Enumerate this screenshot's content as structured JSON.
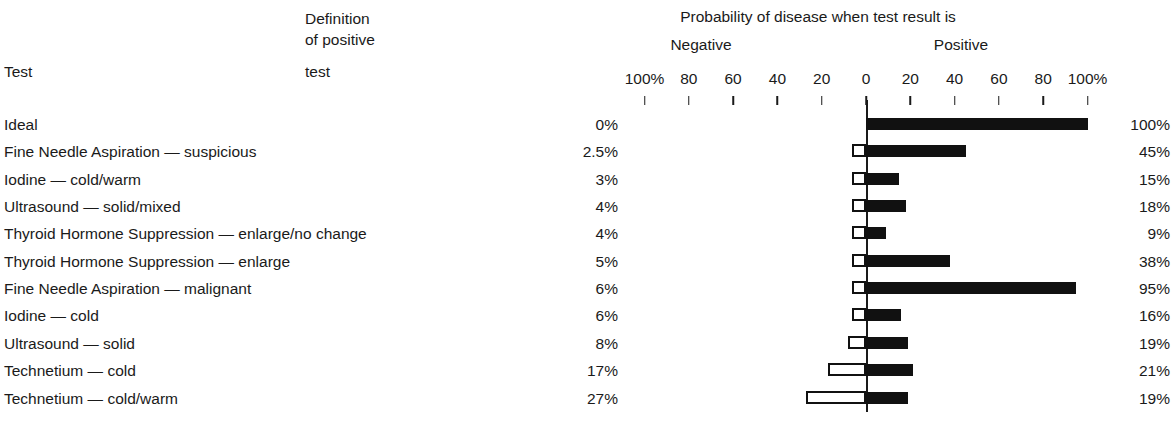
{
  "header": {
    "main_title": "Probability of disease when test result is",
    "negative_label": "Negative",
    "positive_label": "Positive",
    "test_column_label": "Test",
    "definition_column_lines": [
      "Definition",
      "of positive",
      "test"
    ],
    "definition_column_label": "test"
  },
  "axis": {
    "tick_labels": [
      "100%",
      "80",
      "60",
      "40",
      "20",
      "0",
      "20",
      "40",
      "60",
      "80",
      "100%"
    ],
    "tick_values": [
      -100,
      -80,
      -60,
      -40,
      -20,
      0,
      20,
      40,
      60,
      80,
      100
    ],
    "zero_label": "0"
  },
  "colors": {
    "ink": "#1a1a1a",
    "bar_positive": "#111111",
    "bar_negative_fill": "#ffffff",
    "bar_negative_stroke": "#111111",
    "background": "#ffffff"
  },
  "chart_data": {
    "type": "bar",
    "title": "Probability of disease when test result is",
    "subtitle": "",
    "xlabel": "",
    "ylabel": "",
    "orientation": "horizontal-diverging",
    "xlim": [
      -100,
      100
    ],
    "grid": false,
    "legend_position": "none",
    "axis_tick_labels": [
      "100%",
      "80",
      "60",
      "40",
      "20",
      "0",
      "20",
      "40",
      "60",
      "80",
      "100%"
    ],
    "categories": [
      "Ideal",
      "Fine Needle Aspiration — suspicious",
      "Iodine — cold/warm",
      "Ultrasound — solid/mixed",
      "Thyroid Hormone Suppression — enlarge/no change",
      "Thyroid Hormone Suppression — enlarge",
      "Fine Needle Aspiration — malignant",
      "Iodine — cold",
      "Ultrasound — solid",
      "Technetium — cold",
      "Technetium — cold/warm"
    ],
    "series": [
      {
        "name": "Negative",
        "direction": "left",
        "style": "hollow",
        "values": [
          0,
          2.5,
          3,
          4,
          4,
          5,
          6,
          6,
          8,
          17,
          27
        ]
      },
      {
        "name": "Positive",
        "direction": "right",
        "style": "filled",
        "values": [
          100,
          45,
          15,
          18,
          9,
          38,
          95,
          16,
          19,
          21,
          19
        ]
      }
    ]
  },
  "rows": [
    {
      "label": "Ideal",
      "definition": "0%",
      "negative": 0,
      "positive": 100,
      "positive_label": "100%"
    },
    {
      "label": "Fine Needle Aspiration — suspicious",
      "definition": "2.5%",
      "negative": 2.5,
      "positive": 45,
      "positive_label": "45%"
    },
    {
      "label": "Iodine — cold/warm",
      "definition": "3%",
      "negative": 3,
      "positive": 15,
      "positive_label": "15%"
    },
    {
      "label": "Ultrasound — solid/mixed",
      "definition": "4%",
      "negative": 4,
      "positive": 18,
      "positive_label": "18%"
    },
    {
      "label": "Thyroid Hormone Suppression — enlarge/no change",
      "definition": "4%",
      "negative": 4,
      "positive": 9,
      "positive_label": "9%"
    },
    {
      "label": "Thyroid Hormone Suppression — enlarge",
      "definition": "5%",
      "negative": 5,
      "positive": 38,
      "positive_label": "38%"
    },
    {
      "label": "Fine Needle Aspiration — malignant",
      "definition": "6%",
      "negative": 6,
      "positive": 95,
      "positive_label": "95%"
    },
    {
      "label": "Iodine — cold",
      "definition": "6%",
      "negative": 6,
      "positive": 16,
      "positive_label": "16%"
    },
    {
      "label": "Ultrasound — solid",
      "definition": "8%",
      "negative": 8,
      "positive": 19,
      "positive_label": "19%"
    },
    {
      "label": "Technetium — cold",
      "definition": "17%",
      "negative": 17,
      "positive": 21,
      "positive_label": "21%"
    },
    {
      "label": "Technetium — cold/warm",
      "definition": "27%",
      "negative": 27,
      "positive": 19,
      "positive_label": "19%"
    }
  ]
}
